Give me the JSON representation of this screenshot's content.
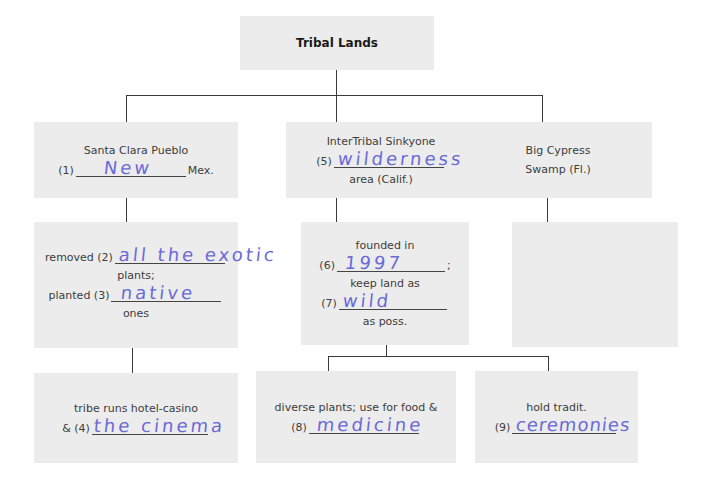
{
  "root": {
    "label": "Tribal Lands"
  },
  "columns": [
    {
      "top": {
        "label": "Santa Clara Pueblo",
        "blank_no": "(1)",
        "answer": "New",
        "suffix": "Mex."
      },
      "middle": {
        "line1_prefix": "removed (2)",
        "answer1": "all the exotic",
        "line2": "plants;",
        "line3_prefix": "planted (3)",
        "answer3": "native",
        "line4": "ones"
      },
      "bottom": {
        "line1": "tribe runs hotel-casino",
        "blank_prefix": "& (4)",
        "answer": "the cinema"
      }
    },
    {
      "top": {
        "label": "InterTribal Sinkyone",
        "blank_no": "(5)",
        "answer": "wilderness",
        "suffix": "area (Calif.)"
      },
      "middle": {
        "line1": "founded in",
        "line2_prefix": "(6)",
        "answer2": "1997",
        "line2_suffix": ";",
        "line3": "keep land as",
        "line4_prefix": "(7)",
        "answer4": "wild",
        "line5": "as poss."
      },
      "children": [
        {
          "line1": "diverse plants; use for food &",
          "blank_prefix": "(8)",
          "answer": "medicine"
        },
        {
          "line1": "hold tradit.",
          "blank_prefix": "(9)",
          "answer": "ceremonies"
        }
      ]
    },
    {
      "top": {
        "line1": "Big Cypress",
        "line2": "Swamp (Fl.)"
      },
      "middle": {
        "empty": true
      }
    }
  ]
}
